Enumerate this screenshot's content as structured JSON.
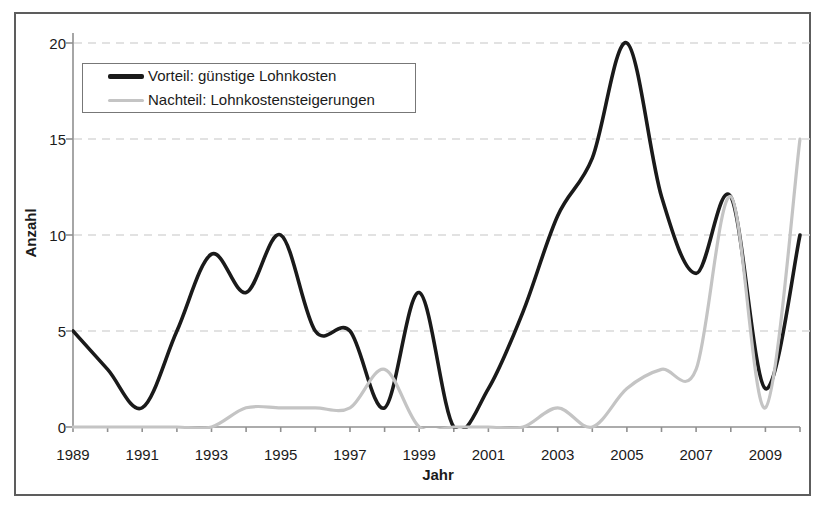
{
  "chart_data": {
    "type": "line",
    "smoothed": true,
    "title": "",
    "xlabel": "Jahr",
    "ylabel": "Anzahl",
    "x": [
      1989,
      1990,
      1991,
      1992,
      1993,
      1994,
      1995,
      1996,
      1997,
      1998,
      1999,
      2000,
      2001,
      2002,
      2003,
      2004,
      2005,
      2006,
      2007,
      2008,
      2009,
      2010
    ],
    "series": [
      {
        "name": "Vorteil: günstige Lohnkosten",
        "color": "#1a1a1a",
        "stroke_width": 3.6,
        "values": [
          5,
          3,
          1,
          5,
          9,
          7,
          10,
          5,
          5,
          1,
          7,
          0,
          2,
          6,
          11,
          14,
          20,
          12,
          8,
          12,
          2,
          10
        ]
      },
      {
        "name": "Nachteil: Lohnkostensteigerungen",
        "color": "#c4c4c4",
        "stroke_width": 3.2,
        "values": [
          0,
          0,
          0,
          0,
          0,
          1,
          1,
          1,
          1,
          3,
          0,
          0,
          0,
          0,
          1,
          0,
          2,
          3,
          3,
          12,
          1,
          15
        ]
      }
    ],
    "xlim": [
      1989,
      2010
    ],
    "ylim": [
      0,
      20
    ],
    "y_ticks": [
      0,
      5,
      10,
      15,
      20
    ],
    "x_tick_labels": [
      "1989",
      "1991",
      "1993",
      "1995",
      "1997",
      "1999",
      "2001",
      "2003",
      "2005",
      "2007",
      "2009"
    ],
    "grid": {
      "horizontal": "dashed",
      "color": "#d9d9d9"
    },
    "axis_color": "#909090",
    "legend_position": "top-left-inside"
  }
}
